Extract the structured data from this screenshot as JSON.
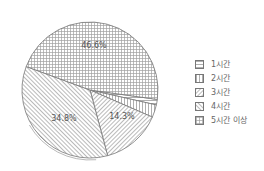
{
  "chart_data": {
    "type": "pie",
    "title": "",
    "categories": [
      "1시간",
      "2시간",
      "3시간",
      "4시간",
      "5시간 이상"
    ],
    "values": [
      1.3,
      3.0,
      14.3,
      34.8,
      46.6
    ],
    "labels_shown": [
      "",
      "",
      "14.3%",
      "34.8%",
      "46.6%"
    ],
    "patterns": [
      "horizontal",
      "vertical",
      "diagonal-forward",
      "diagonal-back",
      "grid"
    ],
    "legend_position": "right",
    "start_angle_deg": 8,
    "direction": "clockwise"
  },
  "legend": {
    "items": [
      {
        "label": "1시간",
        "pattern": "horizontal"
      },
      {
        "label": "2시간",
        "pattern": "vertical"
      },
      {
        "label": "3시간",
        "pattern": "diagonal-forward"
      },
      {
        "label": "4시간",
        "pattern": "diagonal-back"
      },
      {
        "label": "5시간 이상",
        "pattern": "grid"
      }
    ]
  },
  "slice_labels": {
    "s3": "14.3%",
    "s4": "34.8%",
    "s5": "46.6%"
  },
  "colors": {
    "stroke": "#777777",
    "pattern": "#9a9a9a",
    "text": "#555555",
    "background": "#ffffff"
  }
}
